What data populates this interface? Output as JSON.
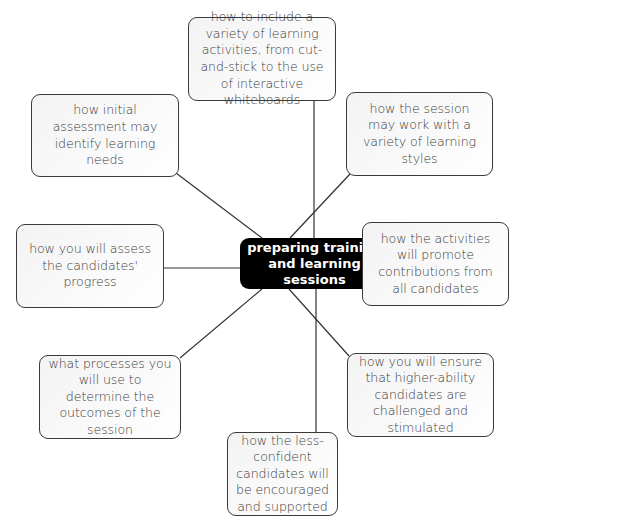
{
  "diagram": {
    "type": "mind-map",
    "center": {
      "label": "preparing training and learning sessions"
    },
    "nodes": [
      {
        "id": "top",
        "label": "how to include a variety of learning activities, from cut-and-stick to the use of interactive whiteboards"
      },
      {
        "id": "top-left",
        "label": "how initial assessment may identify learning needs"
      },
      {
        "id": "top-right",
        "label": "how the session may work with a variety of learning styles"
      },
      {
        "id": "left",
        "label": "how you will assess the candidates' progress"
      },
      {
        "id": "right",
        "label": "how the activities will promote contributions from all candidates"
      },
      {
        "id": "bottom-left",
        "label": "what processes you will use to determine the outcomes of the session"
      },
      {
        "id": "bottom-right",
        "label": "how you will ensure that higher-ability candidates are challenged and stimulated"
      },
      {
        "id": "bottom",
        "label": "how the less-confident candidates will be encouraged and supported"
      }
    ],
    "colors": {
      "center_fill": "#000000",
      "center_text": "#ffffff",
      "node_border": "#3a3a3a",
      "node_text": "#3a3a3a",
      "line": "#333333"
    }
  }
}
